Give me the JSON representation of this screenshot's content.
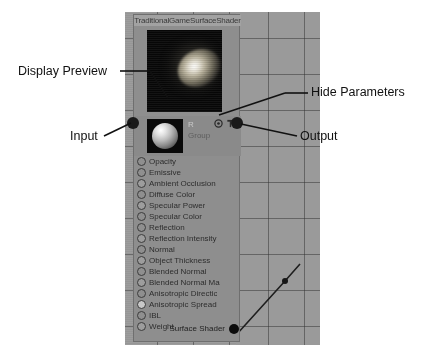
{
  "node": {
    "title": "TraditionalGameSurfaceShader",
    "swatch_label": "R",
    "group_label": "Group",
    "icons": [
      {
        "name": "eye-icon",
        "glyph": "◉"
      },
      {
        "name": "pin-icon",
        "glyph": "⎓"
      }
    ],
    "inputs": [
      {
        "label": "Opacity",
        "state": "empty"
      },
      {
        "label": "Emissive",
        "state": "empty"
      },
      {
        "label": "Ambient Occlusion",
        "state": "filled"
      },
      {
        "label": "Diffuse Color",
        "state": "empty"
      },
      {
        "label": "Specular Power",
        "state": "filled"
      },
      {
        "label": "Specular Color",
        "state": "empty"
      },
      {
        "label": "Reflection",
        "state": "empty"
      },
      {
        "label": "Reflection Intensity",
        "state": "filled"
      },
      {
        "label": "Normal",
        "state": "empty"
      },
      {
        "label": "Object Thickness",
        "state": "filled"
      },
      {
        "label": "Blended Normal",
        "state": "empty"
      },
      {
        "label": "Blended Normal Ma",
        "state": "filled"
      },
      {
        "label": "Anisotropic Directic",
        "state": "empty"
      },
      {
        "label": "Anisotropic Spread",
        "state": "light"
      },
      {
        "label": "IBL",
        "state": "empty"
      },
      {
        "label": "Weight",
        "state": "filled"
      }
    ],
    "output": {
      "label": "Surface Shader"
    }
  },
  "annotations": {
    "display_preview": "Display Preview",
    "input": "Input",
    "hide_parameters": "Hide Parameters",
    "output": "Output"
  },
  "colors": {
    "canvas": "#9a9a9a",
    "node_body": "#8e8e8e",
    "title_bar": "#a2a2a2",
    "annotation_text": "#111111",
    "port_ring": "#3c3c3c"
  }
}
